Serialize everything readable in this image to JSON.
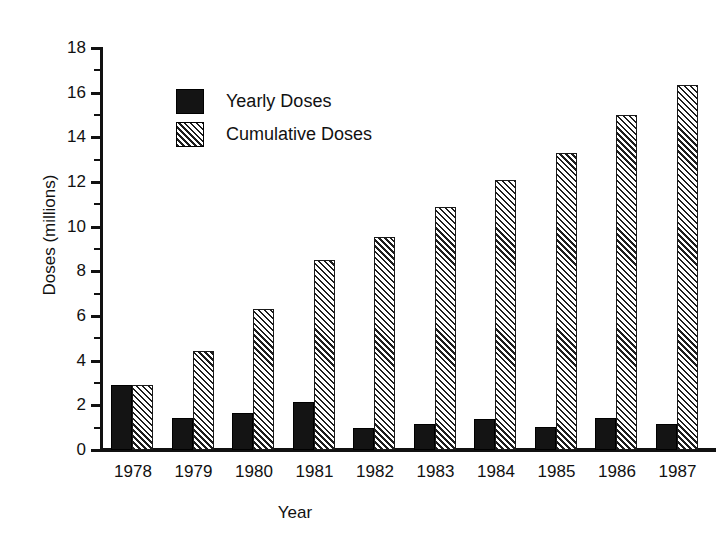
{
  "chart_data": {
    "type": "bar",
    "title": "",
    "xlabel": "Year",
    "ylabel": "Doses (millions)",
    "categories": [
      "1978",
      "1979",
      "1980",
      "1981",
      "1982",
      "1983",
      "1984",
      "1985",
      "1986",
      "1987"
    ],
    "series": [
      {
        "name": "Yearly Doses",
        "values": [
          2.9,
          1.45,
          1.65,
          2.15,
          1.0,
          1.15,
          1.4,
          1.05,
          1.45,
          1.15
        ],
        "color": "#141414",
        "fill": "solid"
      },
      {
        "name": "Cumulative Doses",
        "values": [
          2.9,
          4.45,
          6.3,
          8.5,
          9.55,
          10.9,
          12.1,
          13.3,
          15.0,
          16.35
        ],
        "color": "#1d1d1d",
        "fill": "diagonal-hatch"
      }
    ],
    "ylim": [
      0,
      18
    ],
    "y_ticks": [
      0,
      2,
      4,
      6,
      8,
      10,
      12,
      14,
      16,
      18
    ],
    "y_tick_labels": [
      "0",
      "2",
      "4",
      "6",
      "8",
      "10",
      "12",
      "14",
      "16",
      "18"
    ],
    "y_minor_ticks": [
      1,
      3,
      5,
      7,
      9,
      11,
      13,
      15,
      17
    ],
    "grid": false,
    "legend_position": "upper-left-inside"
  },
  "legend": {
    "entries": [
      {
        "label": "Yearly Doses",
        "swatch": "solid-black-swatch"
      },
      {
        "label": "Cumulative Doses",
        "swatch": "hatched-swatch"
      }
    ]
  },
  "axes": {
    "y_title": "Doses (millions)",
    "x_title": "Year"
  }
}
